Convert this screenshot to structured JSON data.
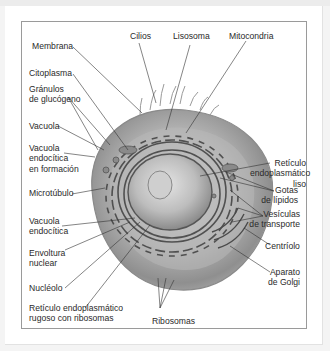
{
  "diagram": {
    "labels": {
      "membrana": "Membrana",
      "cilios": "Cilios",
      "lisosoma": "Lisosoma",
      "mitocondria": "Mitocondria",
      "citoplasma": "Citoplasma",
      "granulos": "Gránulos\nde glucógeno",
      "vacuola": "Vacuola",
      "vacuola_formacion": "Vacuola\nendocítica\nen formación",
      "microtubulo": "Microtúbulo",
      "vacuola_endocitica": "Vacuola\nendocítica",
      "envoltura": "Envoltura\nnuclear",
      "nucleolo": "Nucléolo",
      "rer": "Retículo endoplasmático\nrugoso con ribosomas",
      "ribosomas": "Ribosomas",
      "rel": "Retículo\nendoplasmático\nliso",
      "gotas": "Gotas\nde lípidos",
      "vesiculas": "Vesículas\nde transporte",
      "centriolo": "Centríolo",
      "golgi": "Aparato\nde Golgi"
    },
    "colors": {
      "line": "#333333",
      "frame": "#9a9a9a",
      "cell_light": "#c9c9c9",
      "cell_dark": "#6e6e6e"
    }
  }
}
